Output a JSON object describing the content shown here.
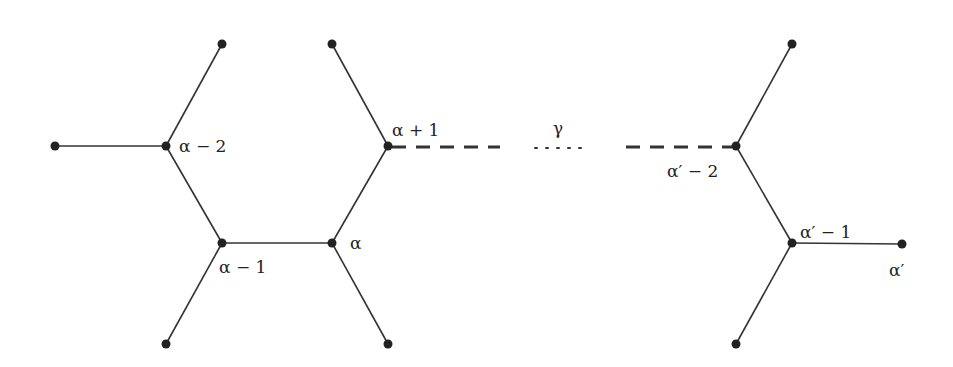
{
  "diagram": {
    "type": "tree / graph path",
    "labels": {
      "alpha_minus_2": "α − 2",
      "alpha_minus_1": "α − 1",
      "alpha": "α",
      "alpha_plus_1": "α + 1",
      "gamma": "γ",
      "alpha_prime_minus_2": "α′ − 2",
      "alpha_prime_minus_1": "α′ − 1",
      "alpha_prime": "α′"
    },
    "nodes": [
      {
        "id": "leaf_left",
        "x": 55,
        "y": 146
      },
      {
        "id": "a-2",
        "x": 166,
        "y": 146
      },
      {
        "id": "leaf_a-2_top",
        "x": 222,
        "y": 44
      },
      {
        "id": "a-1",
        "x": 222,
        "y": 243
      },
      {
        "id": "leaf_a-1_bottom",
        "x": 166,
        "y": 344
      },
      {
        "id": "a",
        "x": 332,
        "y": 243
      },
      {
        "id": "leaf_a_bottom",
        "x": 388,
        "y": 344
      },
      {
        "id": "a+1",
        "x": 388,
        "y": 146
      },
      {
        "id": "leaf_a+1_top",
        "x": 332,
        "y": 44
      },
      {
        "id": "a'-2",
        "x": 736,
        "y": 146
      },
      {
        "id": "leaf_a'-2_top",
        "x": 792,
        "y": 44
      },
      {
        "id": "a'-1",
        "x": 792,
        "y": 243
      },
      {
        "id": "a'",
        "x": 902,
        "y": 244
      },
      {
        "id": "leaf_a'-1_bottom",
        "x": 736,
        "y": 344
      }
    ],
    "edges": [
      {
        "from": "leaf_left",
        "to": "a-2",
        "style": "solid"
      },
      {
        "from": "a-2",
        "to": "leaf_a-2_top",
        "style": "solid"
      },
      {
        "from": "a-2",
        "to": "a-1",
        "style": "solid"
      },
      {
        "from": "a-1",
        "to": "leaf_a-1_bottom",
        "style": "solid"
      },
      {
        "from": "a-1",
        "to": "a",
        "style": "solid"
      },
      {
        "from": "a",
        "to": "leaf_a_bottom",
        "style": "solid"
      },
      {
        "from": "a",
        "to": "a+1",
        "style": "solid"
      },
      {
        "from": "a+1",
        "to": "leaf_a+1_top",
        "style": "solid"
      },
      {
        "from": "a+1",
        "to": "a'-2",
        "style": "dashed-dotted path γ"
      },
      {
        "from": "a'-2",
        "to": "leaf_a'-2_top",
        "style": "solid"
      },
      {
        "from": "a'-2",
        "to": "a'-1",
        "style": "solid"
      },
      {
        "from": "a'-1",
        "to": "a'",
        "style": "solid"
      },
      {
        "from": "a'-1",
        "to": "leaf_a'-1_bottom",
        "style": "solid"
      }
    ]
  }
}
